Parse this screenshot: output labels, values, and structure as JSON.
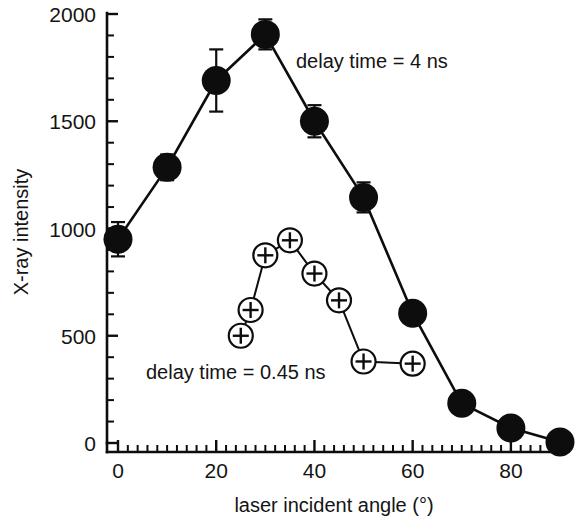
{
  "chart_data": {
    "type": "line",
    "title": "",
    "xlabel": "laser incident angle (°)",
    "ylabel": "X-ray intensity",
    "xlim": [
      0,
      90
    ],
    "ylim": [
      0,
      2000
    ],
    "grid": false,
    "legend_position": "inline-annotation",
    "x_ticks_major": [
      0,
      20,
      40,
      60,
      80
    ],
    "x_tick_labels": [
      "0",
      "20",
      "40",
      "60",
      "80"
    ],
    "x_tick_minor_step": 2,
    "y_ticks_major": [
      0,
      500,
      1000,
      1500,
      2000
    ],
    "y_tick_labels": [
      "0",
      "500",
      "1000",
      "1500",
      "2000"
    ],
    "y_tick_minor_step": 100,
    "series": [
      {
        "name": "delay time = 4 ns",
        "marker": "filled-circle",
        "x": [
          0,
          10,
          20,
          30,
          40,
          50,
          60,
          70,
          80,
          90
        ],
        "values": [
          950,
          1285,
          1690,
          1905,
          1500,
          1145,
          605,
          185,
          70,
          5
        ],
        "yerr": [
          80,
          60,
          145,
          70,
          75,
          70,
          45,
          25,
          18,
          12
        ]
      },
      {
        "name": "delay time = 0.45 ns",
        "marker": "open-circle-plus",
        "x": [
          25,
          27,
          30,
          35,
          40,
          45,
          50,
          60
        ],
        "values": [
          500,
          620,
          875,
          945,
          790,
          665,
          380,
          370
        ],
        "yerr": [
          0,
          0,
          0,
          0,
          0,
          0,
          0,
          0
        ]
      }
    ],
    "annotations": [
      {
        "text": "delay time = 4 ns",
        "x": 38,
        "y": 1760
      },
      {
        "text": "delay time = 0.45 ns",
        "x": 15,
        "y": 345
      }
    ]
  }
}
